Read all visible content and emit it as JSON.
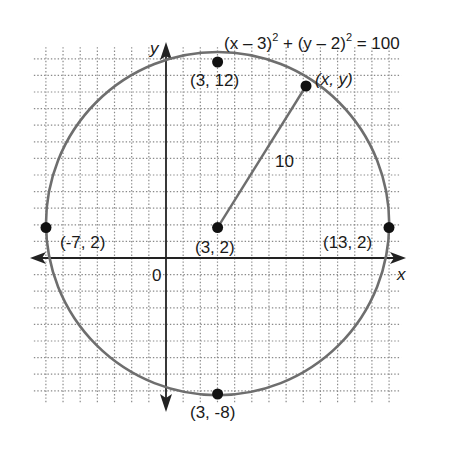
{
  "diagram": {
    "equation": {
      "part1": "(x – 3)",
      "exp1": "2",
      "part2": " + (y – 2)",
      "exp2": "2",
      "part3": " = 100"
    },
    "axes": {
      "x_label": "x",
      "y_label": "y",
      "origin_label": "0"
    },
    "grid": {
      "x_min": -8,
      "x_max": 14,
      "y_min": -9,
      "y_max": 13,
      "style": "dotted",
      "color": "#8a8a8a"
    },
    "circle": {
      "center": [
        3,
        2
      ],
      "radius": 10,
      "stroke_color": "#6e6e6e"
    },
    "radius_label": "10",
    "points": [
      {
        "id": "top",
        "coords": [
          3,
          12
        ],
        "label": "(3, 12)"
      },
      {
        "id": "bottom",
        "coords": [
          3,
          -8
        ],
        "label": "(3, -8)"
      },
      {
        "id": "left",
        "coords": [
          -7,
          2
        ],
        "label": "(-7, 2)"
      },
      {
        "id": "right",
        "coords": [
          13,
          2
        ],
        "label": "(13, 2)"
      },
      {
        "id": "center",
        "coords": [
          3,
          2
        ],
        "label": "(3, 2)"
      },
      {
        "id": "general",
        "coords": [
          8.4,
          10.4
        ],
        "label": "(x, y)"
      }
    ]
  },
  "chart_data": {
    "type": "scatter",
    "xlabel": "x",
    "ylabel": "y",
    "xlim": [
      -8,
      14
    ],
    "ylim": [
      -9,
      13
    ],
    "grid": true,
    "shapes": [
      {
        "type": "circle",
        "center": [
          3,
          2
        ],
        "radius": 10
      },
      {
        "type": "segment",
        "from": [
          3,
          2
        ],
        "to": [
          8.4,
          10.4
        ],
        "label": "10"
      }
    ],
    "series": [
      {
        "name": "labeled points",
        "x": [
          3,
          3,
          -7,
          13,
          3
        ],
        "y": [
          12,
          -8,
          2,
          2,
          2
        ],
        "labels": [
          "(3, 12)",
          "(3, -8)",
          "(-7, 2)",
          "(13, 2)",
          "(3, 2)"
        ]
      },
      {
        "name": "general point",
        "x": [
          8.4
        ],
        "y": [
          10.4
        ],
        "labels": [
          "(x, y)"
        ]
      }
    ],
    "annotations": [
      "0",
      "10",
      "(x − 3)² + (y − 2)² = 100"
    ]
  }
}
